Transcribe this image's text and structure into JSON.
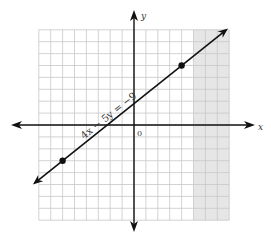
{
  "chart_data": {
    "type": "line",
    "title": "",
    "equation_label": "4x − 5y = −9",
    "xlabel": "x",
    "ylabel": "y",
    "origin_label": "0",
    "xlim": [
      -8,
      8
    ],
    "ylim": [
      -8,
      8
    ],
    "grid": true,
    "line": {
      "slope": 0.8,
      "intercept": 1.8,
      "arrows": "both"
    },
    "points": [
      {
        "x": -6,
        "y": -3
      },
      {
        "x": 4,
        "y": 5
      }
    ],
    "shaded_region": {
      "x_from": 5,
      "x_to": 8,
      "color": "#e6e6e6"
    },
    "colors": {
      "grid": "#c8c8c8",
      "axis": "#111111",
      "line": "#111111"
    }
  }
}
